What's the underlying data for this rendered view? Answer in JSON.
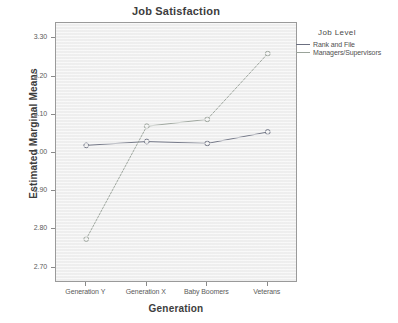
{
  "chart_data": {
    "type": "line",
    "title": "Job Satisfaction",
    "xlabel": "Generation",
    "ylabel": "Estimated Marginal Means",
    "categories": [
      "Generation Y",
      "Generation X",
      "Baby Boomers",
      "Veterans"
    ],
    "series": [
      {
        "name": "Rank and File",
        "values": [
          3.02,
          3.03,
          3.025,
          3.055
        ],
        "color": "#6b6f80"
      },
      {
        "name": "Managers/Supervisors",
        "values": [
          2.775,
          3.07,
          3.088,
          3.26
        ],
        "color": "#9aa39a"
      }
    ],
    "yticks": [
      "3.30",
      "3.20",
      "3.10",
      "3.00",
      "2.90",
      "2.80",
      "2.70"
    ],
    "ytick_values": [
      3.3,
      3.2,
      3.1,
      3.0,
      2.9,
      2.8,
      2.7
    ],
    "ylim": [
      2.66,
      3.34
    ],
    "grid": false,
    "legend_position": "right",
    "legend_title": "Job  Level",
    "marker": "open-circle",
    "plot_background": "#f1f1f1",
    "frame_color": "#9a9a9a"
  },
  "legend": {
    "title": "Job  Level",
    "entries": [
      {
        "label": "Rank and File",
        "color": "#6b6f80"
      },
      {
        "label": "Managers/Supervisors",
        "color": "#9aa39a"
      }
    ]
  }
}
